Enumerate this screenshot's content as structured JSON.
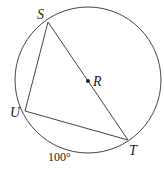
{
  "diagram": {
    "circle": {
      "center": "R",
      "cx": 88,
      "cy": 80,
      "r": 73
    },
    "points": {
      "S": {
        "label": "S",
        "x": 48,
        "y": 22
      },
      "T": {
        "label": "T",
        "x": 128,
        "y": 140
      },
      "U": {
        "label": "U",
        "x": 25,
        "y": 111
      },
      "R": {
        "label": "R",
        "x": 88,
        "y": 81
      }
    },
    "segments": [
      "ST",
      "SU",
      "UT"
    ],
    "arc_label": "100°",
    "colors": {
      "stroke": "#333333",
      "background": "#ffffff"
    }
  }
}
